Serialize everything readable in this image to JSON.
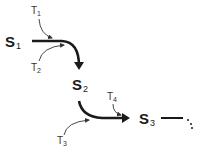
{
  "diagram": {
    "states": [
      {
        "id": "S1",
        "letter": "S",
        "sub": "1"
      },
      {
        "id": "S2",
        "letter": "S",
        "sub": "2"
      },
      {
        "id": "S3",
        "letter": "S",
        "sub": "3"
      }
    ],
    "transitions": [
      {
        "id": "T1",
        "letter": "T",
        "sub": "1"
      },
      {
        "id": "T2",
        "letter": "T",
        "sub": "2"
      },
      {
        "id": "T3",
        "letter": "T",
        "sub": "3"
      },
      {
        "id": "T4",
        "letter": "T",
        "sub": "4"
      }
    ],
    "edges": [
      {
        "from": "S1",
        "to": "S2",
        "inputs": [
          "T1",
          "T2"
        ]
      },
      {
        "from": "S2",
        "to": "S3",
        "inputs": [
          "T3",
          "T4"
        ]
      },
      {
        "from": "S3",
        "to": "…",
        "style": "continuation"
      }
    ],
    "colors": {
      "stroke": "#1a1a1a",
      "thin_stroke": "#333333"
    }
  }
}
